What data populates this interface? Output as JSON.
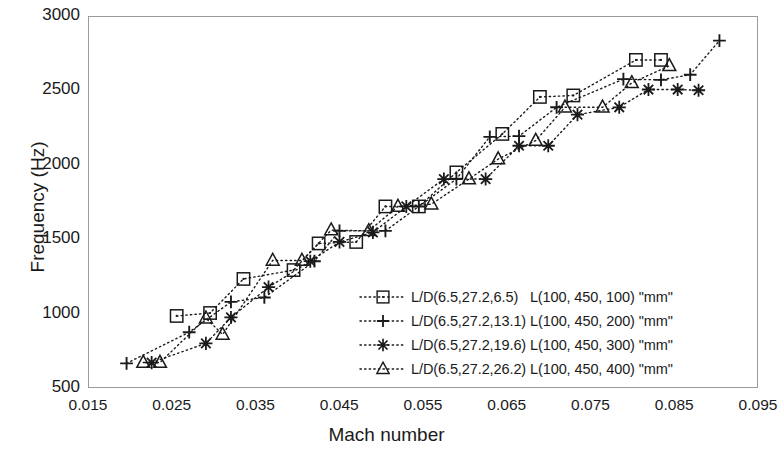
{
  "chart_data": {
    "type": "scatter",
    "title": "",
    "xlabel": "Mach number",
    "ylabel": "Frequency (Hz)",
    "xlim": [
      0.015,
      0.095
    ],
    "ylim": [
      500,
      3000
    ],
    "xticks": [
      "0.015",
      "0.025",
      "0.035",
      "0.045",
      "0.055",
      "0.065",
      "0.075",
      "0.085",
      "0.095"
    ],
    "yticks": [
      "500",
      "1000",
      "1500",
      "2000",
      "2500",
      "3000"
    ],
    "xtick_values": [
      0.015,
      0.025,
      0.035,
      0.045,
      0.055,
      0.065,
      0.075,
      0.085,
      0.095
    ],
    "ytick_values": [
      500,
      1000,
      1500,
      2000,
      2500,
      3000
    ],
    "grid": false,
    "legend_position": "inside lower-right",
    "line_style": "dotted",
    "colors": {
      "ink": "#1a1a1a",
      "frame": "#9a9a9a",
      "background": "#ffffff"
    },
    "series": [
      {
        "name": "L/D(6.5,27.2,6.5)   L(100, 450, 100) \"mm\"",
        "marker": "square-dot",
        "x": [
          0.0255,
          0.0295,
          0.0335,
          0.0395,
          0.0425,
          0.047,
          0.0505,
          0.0545,
          0.059,
          0.0645,
          0.069,
          0.073,
          0.0805,
          0.0835
        ],
        "values": [
          980,
          1000,
          1230,
          1290,
          1470,
          1480,
          1720,
          1720,
          1950,
          2210,
          2460,
          2470,
          2710,
          2710
        ]
      },
      {
        "name": "L/D(6.5,27.2,13.1) L(100, 450, 200) \"mm\"",
        "marker": "plus",
        "x": [
          0.0195,
          0.027,
          0.032,
          0.036,
          0.042,
          0.045,
          0.0505,
          0.0545,
          0.059,
          0.063,
          0.0665,
          0.071,
          0.079,
          0.0835,
          0.087,
          0.0905
        ],
        "values": [
          660,
          870,
          1075,
          1105,
          1350,
          1555,
          1555,
          1720,
          1905,
          2190,
          2195,
          2390,
          2580,
          2575,
          2610,
          2840
        ]
      },
      {
        "name": "L/D(6.5,27.2,19.6) L(100, 450, 300) \"mm\"",
        "marker": "asterisk",
        "x": [
          0.0225,
          0.029,
          0.032,
          0.0365,
          0.0415,
          0.045,
          0.049,
          0.053,
          0.0575,
          0.0625,
          0.0665,
          0.07,
          0.0735,
          0.0785,
          0.082,
          0.0855,
          0.088
        ],
        "values": [
          665,
          795,
          970,
          1175,
          1350,
          1480,
          1545,
          1720,
          1905,
          1905,
          2130,
          2130,
          2340,
          2390,
          2510,
          2510,
          2505
        ]
      },
      {
        "name": "L/D(6.5,27.2,26.2) L(100, 450, 400) \"mm\"",
        "marker": "triangle",
        "x": [
          0.0215,
          0.0235,
          0.029,
          0.031,
          0.037,
          0.0405,
          0.044,
          0.0485,
          0.052,
          0.056,
          0.0605,
          0.064,
          0.0685,
          0.072,
          0.0765,
          0.08,
          0.0845
        ],
        "values": [
          665,
          665,
          965,
          855,
          1355,
          1355,
          1560,
          1555,
          1720,
          1735,
          1905,
          2040,
          2165,
          2390,
          2390,
          2555,
          2670
        ]
      }
    ]
  },
  "axes": {
    "x_title": "Mach number",
    "y_title": "Frequency (Hz)"
  },
  "legend": {
    "items": [
      {
        "marker": "square-dot",
        "label": "L/D(6.5,27.2,6.5)   L(100, 450, 100) \"mm\""
      },
      {
        "marker": "plus",
        "label": "L/D(6.5,27.2,13.1) L(100, 450, 200) \"mm\""
      },
      {
        "marker": "asterisk",
        "label": "L/D(6.5,27.2,19.6) L(100, 450, 300) \"mm\""
      },
      {
        "marker": "triangle",
        "label": "L/D(6.5,27.2,26.2) L(100, 450, 400) \"mm\""
      }
    ]
  }
}
